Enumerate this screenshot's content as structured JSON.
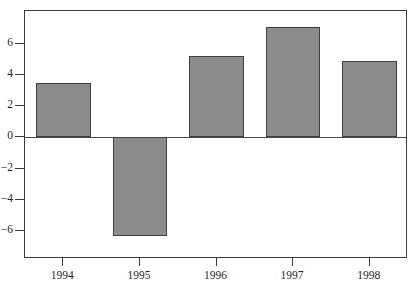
{
  "chart_data": {
    "type": "bar",
    "title": "",
    "subtitle": "",
    "xlabel": "",
    "ylabel": "",
    "categories": [
      "1994",
      "1995",
      "1996",
      "1997",
      "1998"
    ],
    "values": [
      3.5,
      -6.3,
      5.2,
      7.1,
      4.9
    ],
    "series": [
      {
        "name": "",
        "values": [
          3.5,
          -6.3,
          5.2,
          7.1,
          4.9
        ]
      }
    ],
    "ylim": [
      -7.8,
      8.1
    ],
    "xlim": [
      0,
      5
    ],
    "ytick_labels": [
      "6",
      "4",
      "2",
      "0",
      "−2",
      "−4",
      "−6"
    ],
    "ytick_values": [
      6,
      4,
      2,
      0,
      -2,
      -4,
      -6
    ],
    "xtick_labels": [
      "1994",
      "1995",
      "1996",
      "1997",
      "1998"
    ],
    "grid": false,
    "legend": false,
    "legend_position": "none",
    "annotations": [],
    "zero_line": 0,
    "bar_fill_color": "#8c8c8c",
    "bar_border_color": "#3f3f3f",
    "axis_color": "#3b3b3b",
    "background_color": "#ffffff"
  },
  "axes": {
    "y": {
      "ticks": [
        {
          "label": "6",
          "value": 6
        },
        {
          "label": "4",
          "value": 4
        },
        {
          "label": "2",
          "value": 2
        },
        {
          "label": "0",
          "value": 0
        },
        {
          "label": "−2",
          "value": -2
        },
        {
          "label": "−4",
          "value": -4
        },
        {
          "label": "−6",
          "value": -6
        }
      ]
    },
    "x": {
      "ticks": [
        {
          "label": "1994"
        },
        {
          "label": "1995"
        },
        {
          "label": "1996"
        },
        {
          "label": "1997"
        },
        {
          "label": "1998"
        }
      ]
    }
  }
}
